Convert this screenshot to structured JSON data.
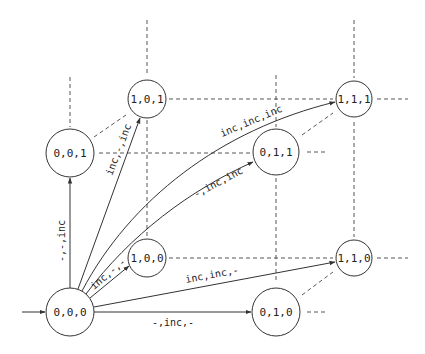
{
  "diagram": {
    "type": "state-transition-lattice",
    "nodes": [
      {
        "id": "n000",
        "label": "0,0,0",
        "x": 70,
        "y": 312,
        "r": 24,
        "initial": true
      },
      {
        "id": "n001",
        "label": "0,0,1",
        "x": 70,
        "y": 153,
        "r": 24
      },
      {
        "id": "n101",
        "label": "1,0,1",
        "x": 147,
        "y": 99,
        "r": 19
      },
      {
        "id": "n100",
        "label": "1,0,0",
        "x": 147,
        "y": 258,
        "r": 19
      },
      {
        "id": "n011",
        "label": "0,1,1",
        "x": 276,
        "y": 152,
        "r": 23
      },
      {
        "id": "n111",
        "label": "1,1,1",
        "x": 354,
        "y": 99,
        "r": 18
      },
      {
        "id": "n110",
        "label": "1,1,0",
        "x": 354,
        "y": 258,
        "r": 18
      },
      {
        "id": "n010",
        "label": "0,1,0",
        "x": 276,
        "y": 312,
        "r": 24
      }
    ],
    "edges": [
      {
        "from": "n000",
        "to": "n001",
        "label": "-,-,inc"
      },
      {
        "from": "n000",
        "to": "n101",
        "label": "inc,-,inc"
      },
      {
        "from": "n000",
        "to": "n111",
        "label": "inc,inc,inc"
      },
      {
        "from": "n000",
        "to": "n011",
        "label": "-,inc,inc"
      },
      {
        "from": "n000",
        "to": "n100",
        "label": "inc,-,-"
      },
      {
        "from": "n000",
        "to": "n110",
        "label": "inc,inc,-"
      },
      {
        "from": "n000",
        "to": "n010",
        "label": "-,inc,-"
      }
    ]
  }
}
